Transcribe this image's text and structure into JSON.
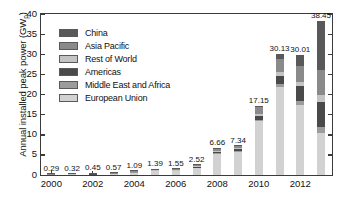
{
  "chart_data": {
    "type": "bar",
    "subtype": "stacked-bar",
    "title": "",
    "xlabel": "",
    "ylabel": "Annual installed peak power (GW",
    "ylabel_subscript": "p",
    "ylabel_suffix": ")",
    "ylim": [
      0,
      40
    ],
    "ytick_values": [
      0,
      5,
      10,
      15,
      20,
      25,
      30,
      35,
      40
    ],
    "ytick_labels": [
      "0",
      "5",
      "10",
      "15",
      "20",
      "25",
      "30",
      "35",
      "40"
    ],
    "grid": false,
    "legend_position": "upper-left-inside",
    "categories": [
      2000,
      2001,
      2002,
      2003,
      2004,
      2005,
      2006,
      2007,
      2008,
      2009,
      2010,
      2011,
      2012,
      2013
    ],
    "xtick_labels": [
      "2000",
      "2002",
      "2004",
      "2006",
      "2008",
      "2010",
      "2012"
    ],
    "xtick_values": [
      2000,
      2002,
      2004,
      2006,
      2008,
      2010,
      2012
    ],
    "totals": [
      0.29,
      0.32,
      0.45,
      0.57,
      1.09,
      1.39,
      1.55,
      2.52,
      6.66,
      7.34,
      17.15,
      30.13,
      30.01,
      38.45
    ],
    "total_labels": [
      "0.29",
      "0.32",
      "0.45",
      "0.57",
      "1.09",
      "1.39",
      "1.55",
      "2.52",
      "6.66",
      "7.34",
      "17.15",
      "30.13",
      "30.01",
      "38.45"
    ],
    "series": [
      {
        "name": "European Union",
        "color": "#d2d2d2",
        "values": [
          0.13,
          0.15,
          0.21,
          0.3,
          0.71,
          0.98,
          1.0,
          1.8,
          5.3,
          5.9,
          13.4,
          22.0,
          17.5,
          10.5
        ]
      },
      {
        "name": "Middle East and Africa",
        "color": "#9c9c9c",
        "values": [
          0.01,
          0.01,
          0.01,
          0.01,
          0.02,
          0.02,
          0.03,
          0.04,
          0.1,
          0.12,
          0.3,
          0.6,
          1.0,
          1.5
        ]
      },
      {
        "name": "Americas",
        "color": "#4a4a4a",
        "values": [
          0.05,
          0.05,
          0.07,
          0.08,
          0.11,
          0.12,
          0.18,
          0.26,
          0.42,
          0.55,
          1.0,
          2.2,
          3.6,
          6.1
        ]
      },
      {
        "name": "Rest of World",
        "color": "#c4c4c4",
        "values": [
          0.02,
          0.02,
          0.03,
          0.03,
          0.05,
          0.06,
          0.07,
          0.1,
          0.2,
          0.23,
          0.55,
          0.9,
          1.2,
          1.9
        ]
      },
      {
        "name": "Asia Pacific",
        "color": "#8a8a8a",
        "values": [
          0.07,
          0.08,
          0.12,
          0.14,
          0.19,
          0.2,
          0.25,
          0.3,
          0.58,
          0.48,
          1.6,
          3.3,
          4.0,
          6.2
        ]
      },
      {
        "name": "China",
        "color": "#595959",
        "values": [
          0.01,
          0.01,
          0.01,
          0.01,
          0.01,
          0.01,
          0.02,
          0.02,
          0.06,
          0.06,
          0.3,
          1.13,
          2.71,
          12.25
        ]
      }
    ]
  },
  "legend": {
    "items": [
      {
        "label": "China",
        "color": "#595959"
      },
      {
        "label": "Asia Pacific",
        "color": "#8a8a8a"
      },
      {
        "label": "Rest of World",
        "color": "#c4c4c4"
      },
      {
        "label": "Americas",
        "color": "#4a4a4a"
      },
      {
        "label": "Middle East and Africa",
        "color": "#9c9c9c"
      },
      {
        "label": "European Union",
        "color": "#d2d2d2"
      }
    ]
  },
  "axis": {
    "frame_color": "#3b3b3b",
    "text_color": "#111111",
    "background": "#ffffff"
  }
}
